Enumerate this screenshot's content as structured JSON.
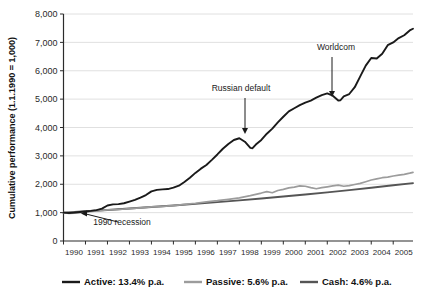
{
  "chart_data": {
    "type": "line",
    "title": "",
    "subtitle": "",
    "xlabel": "",
    "ylabel": "Cumulative performance (1.1.1990 = 1,000)",
    "ylim": [
      0,
      8000
    ],
    "xlim": [
      1990,
      2005.9
    ],
    "grid": true,
    "legend_position": "bottom",
    "ytick_labels": [
      "0",
      "1,000",
      "2,000",
      "3,000",
      "4,000",
      "5,000",
      "6,000",
      "7,000",
      "8,000"
    ],
    "ytick_values": [
      0,
      1000,
      2000,
      3000,
      4000,
      5000,
      6000,
      7000,
      8000
    ],
    "xtick_labels": [
      "1990",
      "1991",
      "1992",
      "1993",
      "1994",
      "1995",
      "1996",
      "1997",
      "1998",
      "1999",
      "2000",
      "2001",
      "2002",
      "2003",
      "2004",
      "2005"
    ],
    "xtick_values": [
      1990,
      1991,
      1992,
      1993,
      1994,
      1995,
      1996,
      1997,
      1998,
      1999,
      2000,
      2001,
      2002,
      2003,
      2004,
      2005
    ],
    "annotations": [
      {
        "id": "russian-default",
        "label": "Russian default",
        "text_x": 241,
        "text_y": 91,
        "arrow_x": 245,
        "arrow_y_top": 98,
        "arrow_y_bottom": 134
      },
      {
        "id": "worldcom",
        "label": "Worldcom",
        "text_x": 336,
        "text_y": 50,
        "arrow_x": 332,
        "arrow_y_top": 57,
        "arrow_y_bottom": 97
      },
      {
        "id": "recession-1990",
        "label": "1990 recession",
        "text_x": 122,
        "text_y": 225,
        "arrow_from_x": 118,
        "arrow_from_y": 222,
        "arrow_to_x": 81,
        "arrow_to_y": 213
      }
    ],
    "series": [
      {
        "name": "Active",
        "legend_label": "Active: 13.4% p.a.",
        "rate": "13.4% p.a.",
        "color": "#1a1a1a",
        "width": 1.9,
        "x": [
          1990.0,
          1990.25,
          1990.5,
          1990.75,
          1991.0,
          1991.25,
          1991.5,
          1991.75,
          1992.0,
          1992.25,
          1992.5,
          1992.75,
          1993.0,
          1993.25,
          1993.5,
          1993.75,
          1994.0,
          1994.25,
          1994.5,
          1994.75,
          1995.0,
          1995.25,
          1995.5,
          1995.75,
          1996.0,
          1996.25,
          1996.5,
          1996.75,
          1997.0,
          1997.25,
          1997.5,
          1997.75,
          1998.0,
          1998.25,
          1998.5,
          1998.6,
          1998.75,
          1999.0,
          1999.25,
          1999.5,
          1999.75,
          2000.0,
          2000.25,
          2000.5,
          2000.75,
          2001.0,
          2001.25,
          2001.5,
          2001.75,
          2002.0,
          2002.25,
          2002.5,
          2002.6,
          2002.75,
          2003.0,
          2003.25,
          2003.5,
          2003.75,
          2004.0,
          2004.25,
          2004.5,
          2004.75,
          2005.0,
          2005.25,
          2005.5,
          2005.75,
          2005.9
        ],
        "y": [
          1000,
          985,
          1000,
          1020,
          1040,
          1060,
          1090,
          1140,
          1250,
          1290,
          1300,
          1330,
          1390,
          1450,
          1530,
          1620,
          1750,
          1800,
          1820,
          1830,
          1880,
          1950,
          2080,
          2230,
          2400,
          2550,
          2680,
          2860,
          3050,
          3250,
          3420,
          3560,
          3620,
          3500,
          3280,
          3270,
          3400,
          3560,
          3780,
          3960,
          4180,
          4380,
          4570,
          4680,
          4790,
          4880,
          4950,
          5050,
          5140,
          5200,
          5120,
          4950,
          4960,
          5100,
          5180,
          5420,
          5800,
          6180,
          6450,
          6430,
          6600,
          6900,
          7000,
          7150,
          7250,
          7420,
          7480
        ]
      },
      {
        "name": "Passive",
        "legend_label": "Passive: 5.6% p.a.",
        "rate": "5.6% p.a.",
        "color": "#9c9c9c",
        "width": 1.7,
        "x": [
          1990.0,
          1990.25,
          1990.5,
          1990.75,
          1991.0,
          1991.5,
          1992.0,
          1992.5,
          1993.0,
          1993.5,
          1994.0,
          1994.5,
          1995.0,
          1995.5,
          1996.0,
          1996.5,
          1997.0,
          1997.5,
          1998.0,
          1998.5,
          1999.0,
          1999.25,
          1999.5,
          1999.75,
          2000.0,
          2000.25,
          2000.5,
          2000.75,
          2001.0,
          2001.25,
          2001.5,
          2001.75,
          2002.0,
          2002.25,
          2002.5,
          2002.75,
          2003.0,
          2003.25,
          2003.5,
          2003.75,
          2004.0,
          2004.25,
          2004.5,
          2004.75,
          2005.0,
          2005.25,
          2005.5,
          2005.75,
          2005.9
        ],
        "y": [
          1000,
          975,
          985,
          1000,
          1020,
          1060,
          1100,
          1110,
          1140,
          1170,
          1200,
          1220,
          1250,
          1290,
          1330,
          1380,
          1420,
          1470,
          1520,
          1600,
          1690,
          1740,
          1700,
          1780,
          1820,
          1870,
          1900,
          1940,
          1930,
          1880,
          1840,
          1880,
          1910,
          1940,
          1970,
          1930,
          1950,
          1990,
          2030,
          2090,
          2150,
          2190,
          2230,
          2250,
          2290,
          2320,
          2350,
          2390,
          2420
        ]
      },
      {
        "name": "Cash",
        "legend_label": "Cash: 4.6% p.a.",
        "rate": "4.6% p.a.",
        "color": "#555555",
        "width": 1.9,
        "x": [
          1990.0,
          1991.0,
          1992.0,
          1993.0,
          1994.0,
          1995.0,
          1996.0,
          1997.0,
          1998.0,
          1999.0,
          2000.0,
          2001.0,
          2002.0,
          2003.0,
          2004.0,
          2005.0,
          2005.9
        ],
        "y": [
          1000,
          1046,
          1094,
          1144,
          1197,
          1252,
          1309,
          1370,
          1433,
          1499,
          1568,
          1640,
          1715,
          1794,
          1877,
          1963,
          2040
        ]
      }
    ]
  }
}
